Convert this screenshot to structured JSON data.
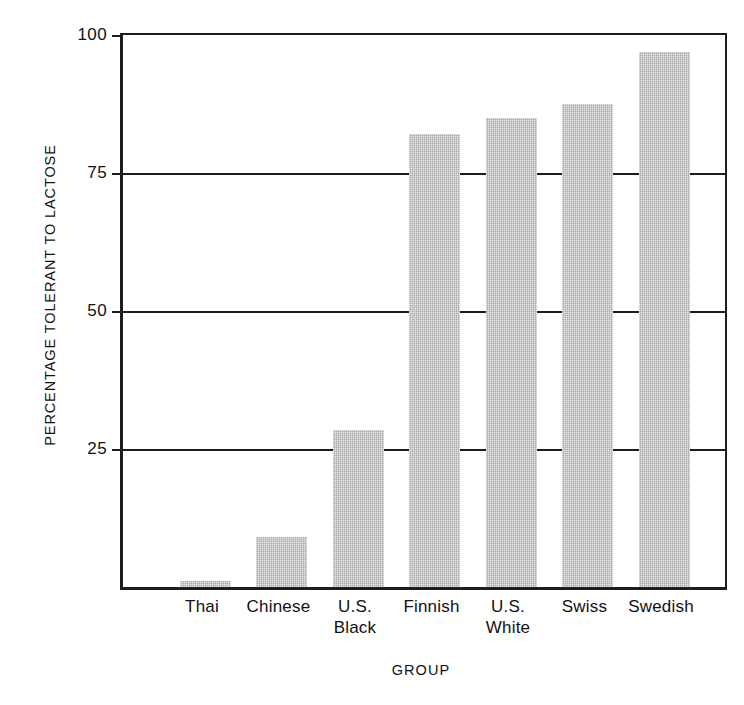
{
  "chart_data": {
    "type": "bar",
    "title": "",
    "subtitle": "",
    "xlabel": "GROUP",
    "ylabel": "PERCENTAGE TOLERANT TO LACTOSE",
    "categories": [
      "Thai",
      "Chinese",
      "U.S. Black",
      "Finnish",
      "U.S. White",
      "Swiss",
      "Swedish"
    ],
    "category_lines": [
      [
        "Thai"
      ],
      [
        "Chinese"
      ],
      [
        "U.S.",
        "Black"
      ],
      [
        "Finnish"
      ],
      [
        "U.S.",
        "White"
      ],
      [
        "Swiss"
      ],
      [
        "Swedish"
      ]
    ],
    "values": [
      1,
      9,
      28.5,
      82,
      85,
      87.5,
      97
    ],
    "ylim": [
      0,
      100
    ],
    "yticks": [
      100,
      75,
      50,
      25
    ],
    "ytick_labels": [
      "100",
      "75",
      "50",
      "25"
    ],
    "grid": true,
    "grid_axis": "y",
    "legend": false,
    "legend_position": "none",
    "bar_color": "#b4b4b4",
    "axis_color": "#1d1d1d",
    "background_color": "#ffffff"
  },
  "axes": {
    "y_title": "PERCENTAGE TOLERANT TO LACTOSE",
    "x_title": "GROUP",
    "y_ticks": [
      {
        "label": "100",
        "value": 100
      },
      {
        "label": "75",
        "value": 75
      },
      {
        "label": "50",
        "value": 50
      },
      {
        "label": "25",
        "value": 25
      }
    ]
  },
  "bars": [
    {
      "label": "Thai",
      "line1": "Thai",
      "line2": "",
      "value": 1
    },
    {
      "label": "Chinese",
      "line1": "Chinese",
      "line2": "",
      "value": 9
    },
    {
      "label": "U.S. Black",
      "line1": "U.S.",
      "line2": "Black",
      "value": 28.5
    },
    {
      "label": "Finnish",
      "line1": "Finnish",
      "line2": "",
      "value": 82
    },
    {
      "label": "U.S. White",
      "line1": "U.S.",
      "line2": "White",
      "value": 85
    },
    {
      "label": "Swiss",
      "line1": "Swiss",
      "line2": "",
      "value": 87.5
    },
    {
      "label": "Swedish",
      "line1": "Swedish",
      "line2": "",
      "value": 97
    }
  ]
}
